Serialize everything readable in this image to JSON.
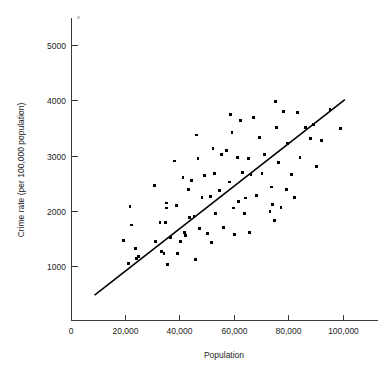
{
  "chart_data": {
    "type": "scatter",
    "title": "",
    "xlabel": "Population",
    "ylabel": "Crime rate (per 100,000 population)",
    "xlim": [
      0,
      112000
    ],
    "ylim": [
      0,
      5500
    ],
    "grid": false,
    "legend": "none",
    "x_ticks": [
      0,
      20000,
      40000,
      60000,
      80000,
      100000
    ],
    "x_tick_labels": [
      "0",
      "20,000",
      "40,000",
      "60,000",
      "80,000",
      "100,000"
    ],
    "y_ticks": [
      1000,
      2000,
      3000,
      4000,
      5000
    ],
    "y_tick_labels": [
      "1000",
      "2000",
      "3000",
      "4000",
      "5000"
    ],
    "series": [
      {
        "name": "Cities",
        "marker": "square",
        "color": "#000000",
        "points": [
          [
            19000,
            1470
          ],
          [
            21000,
            1050
          ],
          [
            21500,
            2090
          ],
          [
            22000,
            1750
          ],
          [
            23500,
            1330
          ],
          [
            24000,
            1140
          ],
          [
            24500,
            1180
          ],
          [
            30500,
            2470
          ],
          [
            31000,
            1450
          ],
          [
            32500,
            1800
          ],
          [
            33000,
            1270
          ],
          [
            34000,
            1240
          ],
          [
            34500,
            1800
          ],
          [
            34800,
            2060
          ],
          [
            35000,
            2150
          ],
          [
            35200,
            1040
          ],
          [
            36500,
            1520
          ],
          [
            38000,
            2910
          ],
          [
            38500,
            2100
          ],
          [
            39000,
            1240
          ],
          [
            40000,
            1450
          ],
          [
            41000,
            2610
          ],
          [
            41500,
            1620
          ],
          [
            42000,
            1560
          ],
          [
            43000,
            2390
          ],
          [
            43500,
            1880
          ],
          [
            44000,
            2560
          ],
          [
            45000,
            1900
          ],
          [
            45500,
            1130
          ],
          [
            46000,
            3380
          ],
          [
            46500,
            2960
          ],
          [
            47000,
            1690
          ],
          [
            48000,
            2250
          ],
          [
            49000,
            2650
          ],
          [
            50000,
            1600
          ],
          [
            51000,
            2270
          ],
          [
            51500,
            1430
          ],
          [
            52000,
            3130
          ],
          [
            52500,
            2680
          ],
          [
            53000,
            1960
          ],
          [
            54500,
            2380
          ],
          [
            55000,
            3030
          ],
          [
            56000,
            1700
          ],
          [
            57000,
            3100
          ],
          [
            58000,
            2530
          ],
          [
            58500,
            3750
          ],
          [
            59000,
            3420
          ],
          [
            59500,
            2060
          ],
          [
            60000,
            1580
          ],
          [
            61000,
            2980
          ],
          [
            61500,
            2180
          ],
          [
            62000,
            3640
          ],
          [
            63000,
            2700
          ],
          [
            63500,
            1960
          ],
          [
            64000,
            2240
          ],
          [
            65000,
            2950
          ],
          [
            65500,
            1620
          ],
          [
            66000,
            2660
          ],
          [
            67000,
            3690
          ],
          [
            68000,
            2280
          ],
          [
            69000,
            3330
          ],
          [
            70000,
            2680
          ],
          [
            71000,
            3030
          ],
          [
            73000,
            2000
          ],
          [
            73500,
            2440
          ],
          [
            74000,
            2120
          ],
          [
            74500,
            1830
          ],
          [
            75000,
            3980
          ],
          [
            75500,
            3520
          ],
          [
            76000,
            2880
          ],
          [
            77000,
            2070
          ],
          [
            78000,
            3800
          ],
          [
            79000,
            2390
          ],
          [
            79500,
            3220
          ],
          [
            81000,
            2670
          ],
          [
            82000,
            2250
          ],
          [
            83000,
            3790
          ],
          [
            84000,
            2980
          ],
          [
            86000,
            3520
          ],
          [
            88000,
            3320
          ],
          [
            89000,
            3570
          ],
          [
            90000,
            2810
          ],
          [
            92000,
            3280
          ],
          [
            95000,
            3840
          ],
          [
            99000,
            3500
          ]
        ]
      }
    ],
    "fit_line": {
      "name": "regression-line",
      "color": "#000000",
      "x_start": 8500,
      "y_start": 480,
      "x_end": 100500,
      "y_end": 4020
    }
  },
  "axes": {
    "x_axis_title": "Population",
    "y_axis_title": "Crime rate (per 100,000 population)",
    "origin_label": "0"
  }
}
